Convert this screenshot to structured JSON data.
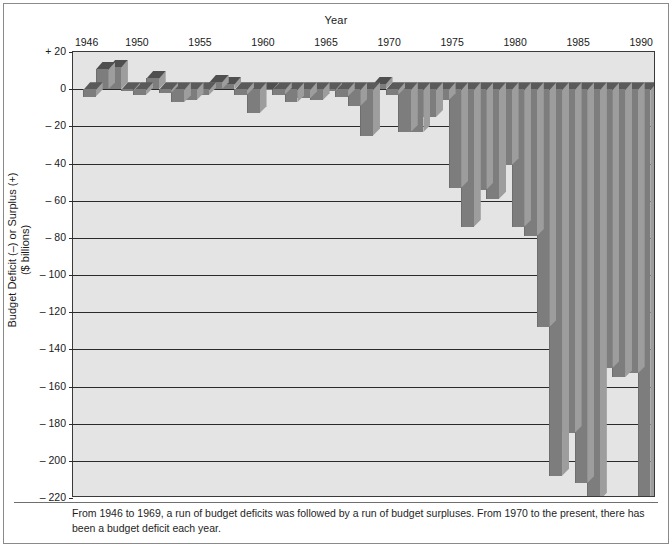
{
  "figure": {
    "caption": "From 1946 to 1969, a run of budget deficits was followed by a run of budget surpluses. From 1970 to the present, there has been a budget deficit each year."
  },
  "axes": {
    "x_title": "Year",
    "y_title_line1": "Budget Deficit (–) or Surplus (+)",
    "y_title_line2": "($ billions)",
    "y_ticks": [
      "+ 20",
      "0",
      "– 20",
      "– 40",
      "– 60",
      "– 80",
      "– 100",
      "– 120",
      "– 140",
      "– 160",
      "– 180",
      "– 200",
      "– 220"
    ],
    "x_ticks": [
      "1946",
      "1950",
      "1955",
      "1960",
      "1965",
      "1970",
      "1975",
      "1980",
      "1985",
      "1990"
    ]
  },
  "colors": {
    "plot_background": "#e4e4e4",
    "bar_face": "#7d7d7d",
    "bar_top": "#5a5a5a",
    "bar_side": "#9d9d9d",
    "axis": "#2a2a2a",
    "text": "#1a1a1a"
  },
  "chart_data": {
    "type": "bar",
    "title": "",
    "subtitle": "",
    "xlabel": "Year",
    "ylabel": "Budget Deficit (–) or Surplus (+) ($ billions)",
    "ylim": [
      -220,
      20
    ],
    "ytick_values": [
      20,
      0,
      -20,
      -40,
      -60,
      -80,
      -100,
      -120,
      -140,
      -160,
      -180,
      -200,
      -220
    ],
    "xtick_values": [
      1946,
      1950,
      1955,
      1960,
      1965,
      1970,
      1975,
      1980,
      1985,
      1990
    ],
    "grid": true,
    "legend": "none",
    "style": "3d-perspective-bars",
    "categories": [
      1946,
      1947,
      1948,
      1949,
      1950,
      1951,
      1952,
      1953,
      1954,
      1955,
      1956,
      1957,
      1958,
      1959,
      1960,
      1961,
      1962,
      1963,
      1964,
      1965,
      1966,
      1967,
      1968,
      1969,
      1970,
      1971,
      1972,
      1973,
      1974,
      1975,
      1976,
      1977,
      1978,
      1979,
      1980,
      1981,
      1982,
      1983,
      1984,
      1985,
      1986,
      1987,
      1988,
      1989,
      1990
    ],
    "values": [
      -4,
      11,
      12,
      -1,
      -3,
      6,
      -2,
      -7,
      -6,
      -3,
      4,
      3,
      -3,
      -13,
      0,
      -3,
      -7,
      -5,
      -6,
      -1,
      -4,
      -9,
      -25,
      3,
      -3,
      -23,
      -23,
      -15,
      -6,
      -53,
      -74,
      -54,
      -59,
      -41,
      -74,
      -79,
      -128,
      -208,
      -185,
      -212,
      -221,
      -150,
      -155,
      -153,
      -221
    ],
    "value_note": "Bar heights read from the chart; positive = surplus, negative = deficit, in billions of dollars"
  },
  "bars": [
    {
      "year": 1946,
      "value": -4
    },
    {
      "year": 1947,
      "value": 11
    },
    {
      "year": 1948,
      "value": 12
    },
    {
      "year": 1949,
      "value": -1
    },
    {
      "year": 1950,
      "value": -3
    },
    {
      "year": 1951,
      "value": 6
    },
    {
      "year": 1952,
      "value": -2
    },
    {
      "year": 1953,
      "value": -7
    },
    {
      "year": 1954,
      "value": -6
    },
    {
      "year": 1955,
      "value": -3
    },
    {
      "year": 1956,
      "value": 4
    },
    {
      "year": 1957,
      "value": 3
    },
    {
      "year": 1958,
      "value": -3
    },
    {
      "year": 1959,
      "value": -13
    },
    {
      "year": 1960,
      "value": 0
    },
    {
      "year": 1961,
      "value": -3
    },
    {
      "year": 1962,
      "value": -7
    },
    {
      "year": 1963,
      "value": -5
    },
    {
      "year": 1964,
      "value": -6
    },
    {
      "year": 1965,
      "value": -1
    },
    {
      "year": 1966,
      "value": -4
    },
    {
      "year": 1967,
      "value": -9
    },
    {
      "year": 1968,
      "value": -25
    },
    {
      "year": 1969,
      "value": 3
    },
    {
      "year": 1970,
      "value": -3
    },
    {
      "year": 1971,
      "value": -23
    },
    {
      "year": 1972,
      "value": -23
    },
    {
      "year": 1973,
      "value": -15
    },
    {
      "year": 1974,
      "value": -6
    },
    {
      "year": 1975,
      "value": -53
    },
    {
      "year": 1976,
      "value": -74
    },
    {
      "year": 1977,
      "value": -54
    },
    {
      "year": 1978,
      "value": -59
    },
    {
      "year": 1979,
      "value": -41
    },
    {
      "year": 1980,
      "value": -74
    },
    {
      "year": 1981,
      "value": -79
    },
    {
      "year": 1982,
      "value": -128
    },
    {
      "year": 1983,
      "value": -208
    },
    {
      "year": 1984,
      "value": -185
    },
    {
      "year": 1985,
      "value": -212
    },
    {
      "year": 1986,
      "value": -221
    },
    {
      "year": 1987,
      "value": -150
    },
    {
      "year": 1988,
      "value": -155
    },
    {
      "year": 1989,
      "value": -153
    },
    {
      "year": 1990,
      "value": -221
    }
  ]
}
